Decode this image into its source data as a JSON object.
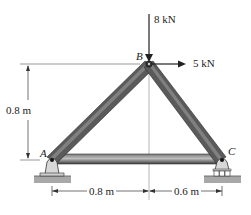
{
  "diagram": {
    "type": "truss",
    "nodes": {
      "A": {
        "label": "A",
        "support": "pin"
      },
      "B": {
        "label": "B"
      },
      "C": {
        "label": "C",
        "support": "roller"
      }
    },
    "members": [
      "AB",
      "BC",
      "AC"
    ],
    "loads": [
      {
        "node": "B",
        "label": "8 kN",
        "direction": "down"
      },
      {
        "node": "B",
        "label": "5 kN",
        "direction": "right"
      }
    ],
    "dimensions": {
      "height": "0.8 m",
      "span_left": "0.8 m",
      "span_right": "0.6 m"
    },
    "colors": {
      "member": "#4a4a4a",
      "member_highlight": "#9a9a9a",
      "ground": "#a8a8a8",
      "line": "#333333"
    }
  }
}
